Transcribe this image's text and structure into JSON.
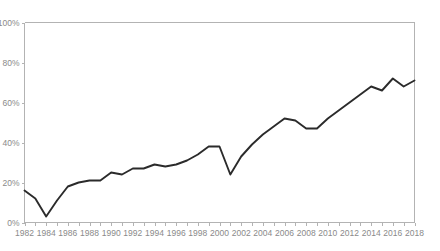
{
  "chart_data": {
    "type": "line",
    "title": "",
    "subtitle": "",
    "xlabel": "",
    "ylabel": "",
    "xlim": [
      1982,
      2018
    ],
    "ylim": [
      0,
      100
    ],
    "grid": false,
    "legend": null,
    "y_ticks": [
      0,
      20,
      40,
      60,
      80,
      100
    ],
    "y_tick_labels": [
      "0%",
      "20%",
      "40%",
      "60%",
      "80%",
      "100%"
    ],
    "x_ticks": [
      1982,
      1983,
      1984,
      1985,
      1986,
      1987,
      1988,
      1989,
      1990,
      1991,
      1992,
      1993,
      1994,
      1995,
      1996,
      1997,
      1998,
      1999,
      2000,
      2001,
      2002,
      2003,
      2004,
      2005,
      2006,
      2007,
      2008,
      2009,
      2010,
      2011,
      2012,
      2013,
      2014,
      2015,
      2016,
      2017,
      2018
    ],
    "x_tick_labels": [
      "1982",
      "",
      "1984",
      "",
      "1986",
      "",
      "1988",
      "",
      "1990",
      "",
      "1992",
      "",
      "1994",
      "",
      "1996",
      "",
      "1998",
      "",
      "2000",
      "",
      "2002",
      "",
      "2004",
      "",
      "2006",
      "",
      "2008",
      "",
      "2010",
      "",
      "2012",
      "",
      "2014",
      "",
      "2016",
      "",
      "2018"
    ],
    "x": [
      1982,
      1983,
      1984,
      1985,
      1986,
      1987,
      1988,
      1989,
      1990,
      1991,
      1992,
      1993,
      1994,
      1995,
      1996,
      1997,
      1998,
      1999,
      2000,
      2001,
      2002,
      2003,
      2004,
      2005,
      2006,
      2007,
      2008,
      2009,
      2010,
      2011,
      2012,
      2013,
      2014,
      2015,
      2016,
      2017,
      2018
    ],
    "values": [
      16,
      12,
      3,
      11,
      18,
      20,
      21,
      21,
      25,
      24,
      27,
      27,
      29,
      28,
      29,
      31,
      34,
      38,
      38,
      24,
      33,
      39,
      44,
      48,
      52,
      51,
      47,
      47,
      52,
      56,
      60,
      64,
      68,
      66,
      72,
      68,
      71
    ],
    "line_color": "#2b2b2b",
    "axis_color": "#b3b3b3",
    "tick_label_color": "#8a8a8a",
    "background_color": "#ffffff",
    "series": [
      {
        "name": "series-1",
        "values": [
          16,
          12,
          3,
          11,
          18,
          20,
          21,
          21,
          25,
          24,
          27,
          27,
          29,
          28,
          29,
          31,
          34,
          38,
          38,
          24,
          33,
          39,
          44,
          48,
          52,
          51,
          47,
          47,
          52,
          56,
          60,
          64,
          68,
          66,
          72,
          68,
          71
        ]
      }
    ]
  }
}
